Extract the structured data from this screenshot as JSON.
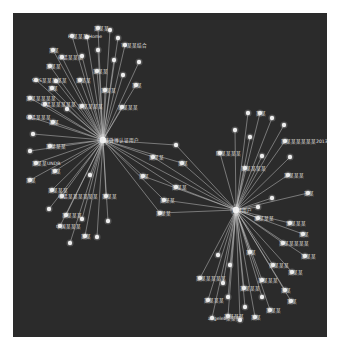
{
  "figure": {
    "background": "#ffffff",
    "panel_color": "#2b2b2b",
    "edge_color": "#cfcfcf",
    "node_color": "#eeeeee",
    "label_color": "#e6e6e6"
  },
  "hubs": [
    {
      "id": "h1",
      "x": 103,
      "y": 140,
      "label": "某某微博认证用户"
    },
    {
      "id": "h2",
      "x": 236,
      "y": 210,
      "label": "某某用户"
    }
  ],
  "nodes": [
    {
      "hub": "h1",
      "x": 98,
      "y": 28,
      "label": "某某某"
    },
    {
      "hub": "h1",
      "x": 110,
      "y": 30,
      "label": ""
    },
    {
      "hub": "h1",
      "x": 72,
      "y": 36,
      "label": "Pe某某某Home"
    },
    {
      "hub": "h1",
      "x": 87,
      "y": 37,
      "label": ""
    },
    {
      "hub": "h1",
      "x": 118,
      "y": 38,
      "label": ""
    },
    {
      "hub": "h1",
      "x": 125,
      "y": 45,
      "label": "TT某某结合"
    },
    {
      "hub": "h1",
      "x": 53,
      "y": 50,
      "label": "某某"
    },
    {
      "hub": "h1",
      "x": 98,
      "y": 50,
      "label": ""
    },
    {
      "hub": "h1",
      "x": 62,
      "y": 57,
      "label": "电话某某某"
    },
    {
      "hub": "h1",
      "x": 82,
      "y": 56,
      "label": ""
    },
    {
      "hub": "h1",
      "x": 114,
      "y": 60,
      "label": ""
    },
    {
      "hub": "h1",
      "x": 139,
      "y": 62,
      "label": ""
    },
    {
      "hub": "h1",
      "x": 50,
      "y": 66,
      "label": "某某某"
    },
    {
      "hub": "h1",
      "x": 97,
      "y": 71,
      "label": "某某某"
    },
    {
      "hub": "h1",
      "x": 36,
      "y": 80,
      "label": "SMS某某某某某"
    },
    {
      "hub": "h1",
      "x": 56,
      "y": 81,
      "label": ""
    },
    {
      "hub": "h1",
      "x": 80,
      "y": 80,
      "label": "某某某"
    },
    {
      "hub": "h1",
      "x": 123,
      "y": 75,
      "label": ""
    },
    {
      "hub": "h1",
      "x": 136,
      "y": 85,
      "label": "某某"
    },
    {
      "hub": "h1",
      "x": 52,
      "y": 88,
      "label": "某某"
    },
    {
      "hub": "h1",
      "x": 105,
      "y": 90,
      "label": "某某某"
    },
    {
      "hub": "h1",
      "x": 30,
      "y": 98,
      "label": "某某某某某某"
    },
    {
      "hub": "h1",
      "x": 45,
      "y": 104,
      "label": "电话某某某某某"
    },
    {
      "hub": "h1",
      "x": 67,
      "y": 109,
      "label": ""
    },
    {
      "hub": "h1",
      "x": 82,
      "y": 106,
      "label": "某某某某某"
    },
    {
      "hub": "h1",
      "x": 122,
      "y": 107,
      "label": "某某某某"
    },
    {
      "hub": "h1",
      "x": 30,
      "y": 117,
      "label": "电话某某某"
    },
    {
      "hub": "h1",
      "x": 53,
      "y": 122,
      "label": "某某"
    },
    {
      "hub": "h1",
      "x": 33,
      "y": 134,
      "label": ""
    },
    {
      "hub": "h1",
      "x": 50,
      "y": 146,
      "label": "某某某某"
    },
    {
      "hub": "h1",
      "x": 30,
      "y": 151,
      "label": ""
    },
    {
      "hub": "h1",
      "x": 36,
      "y": 163,
      "label": "某某某UNDR"
    },
    {
      "hub": "h1",
      "x": 55,
      "y": 171,
      "label": "某某"
    },
    {
      "hub": "h1",
      "x": 30,
      "y": 180,
      "label": "某某"
    },
    {
      "hub": "h1",
      "x": 90,
      "y": 175,
      "label": ""
    },
    {
      "hub": "h1",
      "x": 52,
      "y": 190,
      "label": "某某某某"
    },
    {
      "hub": "h1",
      "x": 62,
      "y": 196,
      "label": "电话某某某某某某"
    },
    {
      "hub": "h1",
      "x": 106,
      "y": 196,
      "label": "某某某"
    },
    {
      "hub": "h1",
      "x": 49,
      "y": 209,
      "label": ""
    },
    {
      "hub": "h1",
      "x": 66,
      "y": 215,
      "label": "某某某某"
    },
    {
      "hub": "h1",
      "x": 60,
      "y": 226,
      "label": "中国某某某"
    },
    {
      "hub": "h1",
      "x": 82,
      "y": 219,
      "label": ""
    },
    {
      "hub": "h1",
      "x": 108,
      "y": 221,
      "label": ""
    },
    {
      "hub": "h1",
      "x": 85,
      "y": 236,
      "label": "某某"
    },
    {
      "hub": "h1",
      "x": 70,
      "y": 243,
      "label": ""
    },
    {
      "hub": "h1",
      "x": 97,
      "y": 237,
      "label": ""
    },
    {
      "hub": "h1",
      "x": 143,
      "y": 176,
      "label": "某某"
    },
    {
      "hub": "h1",
      "x": 153,
      "y": 157,
      "label": "某某某"
    },
    {
      "hub": "h1",
      "x": 176,
      "y": 145,
      "label": ""
    },
    {
      "hub": "h1",
      "x": 182,
      "y": 163,
      "label": "某某"
    },
    {
      "hub": "h1",
      "x": 176,
      "y": 187,
      "label": "某某某"
    },
    {
      "hub": "h1",
      "x": 164,
      "y": 200,
      "label": "某某某"
    },
    {
      "hub": "h1",
      "x": 160,
      "y": 213,
      "label": "某某某"
    },
    {
      "hub": "h2",
      "x": 248,
      "y": 113,
      "label": ""
    },
    {
      "hub": "h2",
      "x": 260,
      "y": 113,
      "label": "某某"
    },
    {
      "hub": "h2",
      "x": 272,
      "y": 118,
      "label": ""
    },
    {
      "hub": "h2",
      "x": 284,
      "y": 125,
      "label": ""
    },
    {
      "hub": "h2",
      "x": 235,
      "y": 130,
      "label": ""
    },
    {
      "hub": "h2",
      "x": 250,
      "y": 137,
      "label": ""
    },
    {
      "hub": "h2",
      "x": 285,
      "y": 141,
      "label": "某某某某某某某2013"
    },
    {
      "hub": "h2",
      "x": 220,
      "y": 153,
      "label": "陈某某某某"
    },
    {
      "hub": "h2",
      "x": 262,
      "y": 156,
      "label": ""
    },
    {
      "hub": "h2",
      "x": 290,
      "y": 157,
      "label": ""
    },
    {
      "hub": "h2",
      "x": 245,
      "y": 168,
      "label": "某某某某某"
    },
    {
      "hub": "h2",
      "x": 288,
      "y": 175,
      "label": "某某某某"
    },
    {
      "hub": "h2",
      "x": 308,
      "y": 193,
      "label": "某某"
    },
    {
      "hub": "h2",
      "x": 272,
      "y": 198,
      "label": ""
    },
    {
      "hub": "h2",
      "x": 258,
      "y": 207,
      "label": ""
    },
    {
      "hub": "h2",
      "x": 258,
      "y": 218,
      "label": "某某某某"
    },
    {
      "hub": "h2",
      "x": 290,
      "y": 223,
      "label": "某某某某"
    },
    {
      "hub": "h2",
      "x": 303,
      "y": 234,
      "label": "某某"
    },
    {
      "hub": "h2",
      "x": 283,
      "y": 243,
      "label": "某某某某某某"
    },
    {
      "hub": "h2",
      "x": 305,
      "y": 256,
      "label": "某某某"
    },
    {
      "hub": "h2",
      "x": 218,
      "y": 255,
      "label": ""
    },
    {
      "hub": "h2",
      "x": 250,
      "y": 252,
      "label": "某某"
    },
    {
      "hub": "h2",
      "x": 273,
      "y": 265,
      "label": "某某某某"
    },
    {
      "hub": "h2",
      "x": 292,
      "y": 272,
      "label": "某某某"
    },
    {
      "hub": "h2",
      "x": 230,
      "y": 265,
      "label": ""
    },
    {
      "hub": "h2",
      "x": 200,
      "y": 278,
      "label": "某某某某某某"
    },
    {
      "hub": "h2",
      "x": 223,
      "y": 283,
      "label": ""
    },
    {
      "hub": "h2",
      "x": 262,
      "y": 280,
      "label": "某某某某"
    },
    {
      "hub": "h2",
      "x": 244,
      "y": 288,
      "label": "某某某某"
    },
    {
      "hub": "h2",
      "x": 285,
      "y": 290,
      "label": "某某"
    },
    {
      "hub": "h2",
      "x": 208,
      "y": 300,
      "label": "某某某某"
    },
    {
      "hub": "h2",
      "x": 228,
      "y": 297,
      "label": ""
    },
    {
      "hub": "h2",
      "x": 262,
      "y": 297,
      "label": ""
    },
    {
      "hub": "h2",
      "x": 291,
      "y": 301,
      "label": "某某"
    },
    {
      "hub": "h2",
      "x": 228,
      "y": 316,
      "label": "某某某某"
    },
    {
      "hub": "h2",
      "x": 240,
      "y": 320,
      "label": ""
    },
    {
      "hub": "h2",
      "x": 255,
      "y": 317,
      "label": "某某"
    },
    {
      "hub": "h2",
      "x": 270,
      "y": 310,
      "label": "某某某"
    },
    {
      "hub": "h2",
      "x": 212,
      "y": 318,
      "label": "angeleb某某某"
    },
    {
      "hub": "h2",
      "x": 245,
      "y": 307,
      "label": ""
    }
  ]
}
